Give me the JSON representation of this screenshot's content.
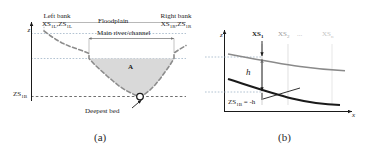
{
  "figure": {
    "panel_a": {
      "caption": "(a)",
      "axis_z": "z",
      "labels": {
        "left_bank_title": "Left bank",
        "left_bank_vars": "XS1L, ZS1L",
        "right_bank_title": "Right bank",
        "right_bank_vars": "XS1R, ZS1R",
        "floodplain": "Floodplain",
        "main_channel": "Main river/channel",
        "area": "A",
        "datum": "ZS1B",
        "deepest_bed": "Deepest bed"
      }
    },
    "panel_b": {
      "caption": "(b)",
      "axis_z": "z",
      "axis_x": "x",
      "labels": {
        "xs_first": "XS1",
        "xs_second": "XS2",
        "xs_ellipsis": "...",
        "xs_last": "XSn",
        "depth": "h",
        "bed_equation": "ZS1B = -h"
      }
    }
  },
  "colors": {
    "ink": "#1a1a1a",
    "area_fill": "#d9d9d9",
    "bank_dash": "#8c8c8c",
    "guide": "#9fb4c7",
    "faded_1": "#9a9a9a",
    "faded_2": "#c4c4c4",
    "curve_top": "#8a8a8a",
    "curve_bottom": "#1a1a1a"
  }
}
